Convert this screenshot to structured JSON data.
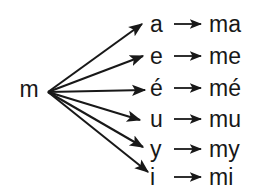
{
  "diagram": {
    "type": "radial-mapping",
    "source": {
      "label": "m",
      "description": "consonant"
    },
    "stroke_color": "#181818",
    "background_color": "#ffffff",
    "rows": [
      {
        "vowel": "a",
        "syllable": "ma"
      },
      {
        "vowel": "e",
        "syllable": "me"
      },
      {
        "vowel": "é",
        "syllable": "mé"
      },
      {
        "vowel": "u",
        "syllable": "mu"
      },
      {
        "vowel": "y",
        "syllable": "my"
      },
      {
        "vowel": "i",
        "syllable": "mi"
      }
    ]
  }
}
